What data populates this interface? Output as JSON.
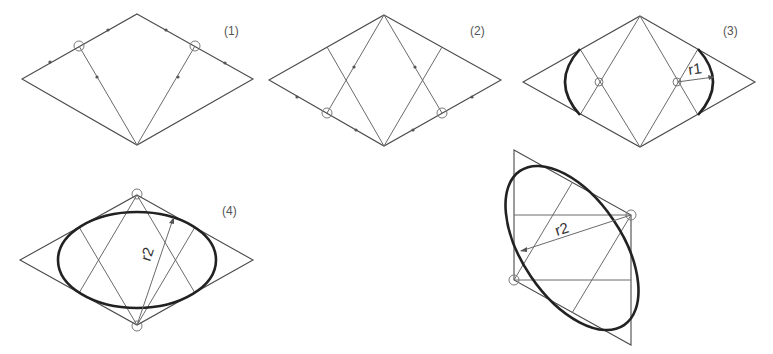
{
  "figures": [
    {
      "id": 1,
      "label": "(1)"
    },
    {
      "id": 2,
      "label": "(2)"
    },
    {
      "id": 3,
      "label": "(3)",
      "radius_label": "r1"
    },
    {
      "id": 4,
      "label": "(4)",
      "radius_label": "r2"
    },
    {
      "id": 5,
      "label": "",
      "radius_label": "r2"
    }
  ],
  "colors": {
    "line": "#6a6a6a",
    "ellipse": "#222222",
    "background": "#ffffff"
  }
}
